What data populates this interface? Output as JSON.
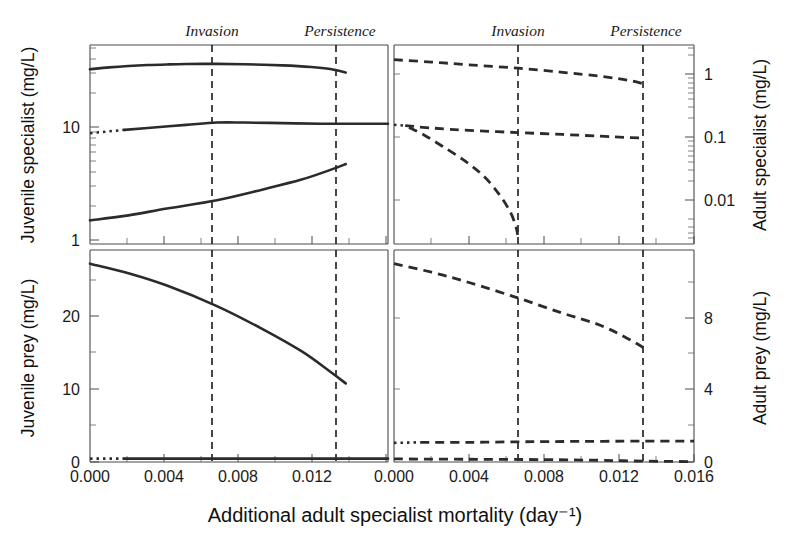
{
  "figure": {
    "xlabel": "Additional adult specialist mortality (day⁻¹)",
    "annotations": [
      {
        "label": "Invasion",
        "x": 0.0066
      },
      {
        "label": "Persistence",
        "x": 0.0133
      }
    ]
  },
  "chart_data": [
    {
      "id": "juvenile-specialist",
      "type": "line",
      "title": "",
      "ylabel": "Juvenile specialist (mg/L)",
      "xlabel": "Additional adult specialist mortality (day⁻¹)",
      "yscale": "log",
      "ylim": [
        1,
        40
      ],
      "xlim": [
        0.0,
        0.0155
      ],
      "ytick_labels": [
        "10",
        "1"
      ],
      "ytick_values": [
        10,
        1
      ],
      "xtick_labels": [
        "0.000",
        "0.004",
        "0.008",
        "0.012"
      ],
      "xtick_values": [
        0.0,
        0.004,
        0.008,
        0.012
      ],
      "grid": false,
      "panel": "top-left",
      "series": [
        {
          "name": "upper-stable-branch",
          "style": "solid",
          "x": [
            0.0,
            0.001,
            0.002,
            0.003,
            0.004,
            0.005,
            0.0066,
            0.008,
            0.01,
            0.0115,
            0.0125,
            0.0133
          ],
          "y": [
            25.5,
            26.4,
            27.1,
            27.6,
            27.9,
            28.1,
            28.2,
            28.0,
            27.4,
            26.6,
            25.6,
            24.0
          ]
        },
        {
          "name": "mid-branch-solid",
          "style": "solid",
          "x": [
            0.0018,
            0.003,
            0.005,
            0.0066,
            0.008,
            0.01,
            0.012,
            0.0133,
            0.0155
          ],
          "y": [
            8.3,
            8.6,
            9.1,
            9.5,
            9.5,
            9.4,
            9.3,
            9.3,
            9.3
          ]
        },
        {
          "name": "mid-branch-dotted",
          "style": "dotted",
          "x": [
            0.0,
            0.0018
          ],
          "y": [
            7.8,
            8.3
          ]
        },
        {
          "name": "lower-unstable-branch",
          "style": "solid",
          "x": [
            0.0,
            0.002,
            0.004,
            0.0066,
            0.009,
            0.011,
            0.0125,
            0.0133
          ],
          "y": [
            1.55,
            1.7,
            1.93,
            2.25,
            2.75,
            3.3,
            3.95,
            4.4
          ]
        }
      ]
    },
    {
      "id": "adult-specialist",
      "type": "line",
      "title": "",
      "ylabel": "Adult specialist (mg/L)",
      "xlabel": "Additional adult specialist mortality (day⁻¹)",
      "yscale": "log",
      "ylim": [
        0.002,
        3.0
      ],
      "xlim": [
        0.0,
        0.016
      ],
      "ytick_labels": [
        "1",
        "0.1",
        "0.01"
      ],
      "ytick_values": [
        1,
        0.1,
        0.01
      ],
      "xtick_labels": [
        "0.000",
        "0.004",
        "0.008",
        "0.012",
        "0.016"
      ],
      "xtick_values": [
        0.0,
        0.004,
        0.008,
        0.012,
        0.016
      ],
      "grid": false,
      "panel": "top-right",
      "series": [
        {
          "name": "upper-stable-branch",
          "style": "dashed",
          "x": [
            0.0,
            0.002,
            0.004,
            0.0066,
            0.009,
            0.011,
            0.0125,
            0.0133
          ],
          "y": [
            1.75,
            1.6,
            1.45,
            1.28,
            1.1,
            0.95,
            0.82,
            0.72
          ]
        },
        {
          "name": "mid-branch-dashed",
          "style": "dashed",
          "x": [
            0.0006,
            0.002,
            0.004,
            0.0066,
            0.009,
            0.011,
            0.0125,
            0.0133
          ],
          "y": [
            0.155,
            0.142,
            0.13,
            0.12,
            0.112,
            0.105,
            0.1,
            0.098
          ]
        },
        {
          "name": "mid-branch-dotted-start",
          "style": "dotted",
          "x": [
            0.0,
            0.0006
          ],
          "y": [
            0.16,
            0.155
          ]
        },
        {
          "name": "lower-collapsing-branch",
          "style": "dashed",
          "x": [
            0.0008,
            0.0016,
            0.0026,
            0.0038,
            0.0048,
            0.0056,
            0.0062,
            0.0065,
            0.0066
          ],
          "y": [
            0.145,
            0.11,
            0.072,
            0.042,
            0.024,
            0.0125,
            0.0065,
            0.0038,
            0.0028
          ]
        }
      ]
    },
    {
      "id": "juvenile-prey",
      "type": "line",
      "title": "",
      "ylabel": "Juvenile prey (mg/L)",
      "xlabel": "Additional adult specialist mortality (day⁻¹)",
      "yscale": "linear",
      "ylim": [
        0,
        31
      ],
      "xlim": [
        0.0,
        0.0155
      ],
      "ytick_labels": [
        "20",
        "10",
        "0"
      ],
      "ytick_values": [
        20,
        10,
        0
      ],
      "xtick_labels": [
        "0.000",
        "0.004",
        "0.008",
        "0.012"
      ],
      "xtick_values": [
        0.0,
        0.004,
        0.008,
        0.012
      ],
      "grid": false,
      "panel": "bottom-left",
      "series": [
        {
          "name": "declining-branch",
          "style": "solid",
          "x": [
            0.0,
            0.002,
            0.004,
            0.0066,
            0.009,
            0.011,
            0.0125,
            0.0133
          ],
          "y": [
            29.0,
            27.6,
            25.8,
            22.8,
            19.4,
            16.2,
            13.2,
            11.5
          ]
        },
        {
          "name": "zero-branch-solid",
          "style": "solid",
          "x": [
            0.0018,
            0.0066,
            0.0133,
            0.0155
          ],
          "y": [
            0.5,
            0.5,
            0.5,
            0.5
          ]
        },
        {
          "name": "zero-branch-dotted",
          "style": "dotted",
          "x": [
            0.0,
            0.0018
          ],
          "y": [
            0.5,
            0.5
          ]
        }
      ]
    },
    {
      "id": "adult-prey",
      "type": "line",
      "title": "",
      "ylabel": "Adult prey (mg/L)",
      "xlabel": "Additional adult specialist mortality (day⁻¹)",
      "yscale": "linear",
      "ylim": [
        0,
        12.4
      ],
      "xlim": [
        0.0,
        0.016
      ],
      "ytick_labels": [
        "8",
        "4",
        "0"
      ],
      "ytick_values": [
        8,
        4,
        0
      ],
      "xtick_labels": [
        "0.000",
        "0.004",
        "0.008",
        "0.012",
        "0.016"
      ],
      "xtick_values": [
        0.0,
        0.004,
        0.008,
        0.012,
        0.016
      ],
      "grid": false,
      "panel": "bottom-right",
      "series": [
        {
          "name": "declining-branch",
          "style": "dashed",
          "x": [
            0.0,
            0.002,
            0.004,
            0.0066,
            0.009,
            0.011,
            0.0125,
            0.0133
          ],
          "y": [
            11.6,
            11.1,
            10.5,
            9.6,
            8.7,
            8.0,
            7.2,
            6.7
          ]
        },
        {
          "name": "low-branch-dashed",
          "style": "dashed",
          "x": [
            0.0014,
            0.004,
            0.0066,
            0.009,
            0.0133,
            0.016
          ],
          "y": [
            1.15,
            1.15,
            1.18,
            1.2,
            1.22,
            1.22
          ]
        },
        {
          "name": "low-branch-dotted",
          "style": "dotted",
          "x": [
            0.0,
            0.0014
          ],
          "y": [
            1.12,
            1.15
          ]
        },
        {
          "name": "near-zero-branch",
          "style": "dashed",
          "x": [
            0.0,
            0.004,
            0.008,
            0.011,
            0.0133,
            0.016
          ],
          "y": [
            0.18,
            0.16,
            0.14,
            0.1,
            0.05,
            0.02
          ]
        }
      ]
    }
  ]
}
